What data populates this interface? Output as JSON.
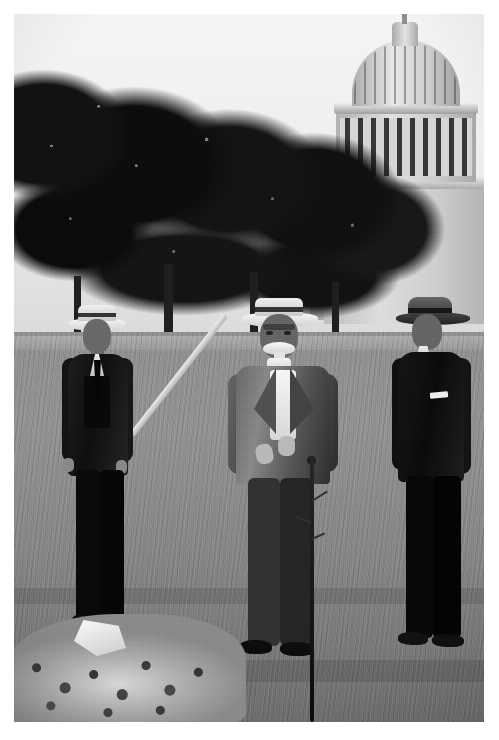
{
  "page": {
    "background_color": "#ffffff",
    "width": 499,
    "height": 740,
    "type": "scanned-book-page-with-photograph"
  },
  "photograph": {
    "name": "historical-black-and-white-photograph",
    "medium": "halftone black-and-white photographic print",
    "orientation": "portrait",
    "frame": {
      "left": 14,
      "top": 14,
      "width": 470,
      "height": 708
    },
    "scene_description": "Three men stand on a lawn in front of the United States Capitol at a tree-planting ceremony; the central elderly man holds a shovel beside a freshly dug mound of earth and a newly set sapling stake.",
    "tones": {
      "sky": "#e8e9e9",
      "tree_canopy": "#1a1a1a",
      "lawn": "#8a8a8a",
      "capitol_stone": "#cccccc",
      "dirt_mound": "#b9b7b0",
      "dark_suits": "#141414"
    }
  },
  "subjects": [
    {
      "id": "man-left",
      "position": "left",
      "headwear": "straw boater hat",
      "attire": "dark three-piece suit with white shirt and dark necktie",
      "pose": "standing, arms at sides, facing camera"
    },
    {
      "id": "man-center",
      "position": "center",
      "headwear": "straw boater hat",
      "attire": "light tweed jacket, white shirt, dark trousers",
      "features": "elderly, white walrus mustache",
      "pose": "standing, both hands resting on the handle of a long shovel"
    },
    {
      "id": "man-right",
      "position": "right",
      "headwear": "dark soft-brim hat",
      "attire": "dark suit with white pocket square",
      "pose": "standing, hands behind back, turned slightly left"
    }
  ],
  "objects": [
    {
      "id": "capitol-dome",
      "label": "United States Capitol dome",
      "location": "upper right background"
    },
    {
      "id": "shovel",
      "label": "long-handled shovel",
      "location": "held by center man, blade in the dirt at lower left"
    },
    {
      "id": "dirt-mound",
      "label": "mound of freshly dug earth",
      "location": "bottom left foreground"
    },
    {
      "id": "sapling-stake",
      "label": "thin sapling / planting stake",
      "location": "right of center, extending to bottom edge"
    },
    {
      "id": "tree-line",
      "label": "dense tree canopy",
      "location": "background across the top"
    },
    {
      "id": "lawn-path",
      "label": "light gravel path along the tree line",
      "location": "mid background"
    }
  ],
  "caption": {
    "text": "",
    "note": "caption line is clipped by the bottom edge of the page; only the faint tops of serif letters remain and no words are legible"
  }
}
